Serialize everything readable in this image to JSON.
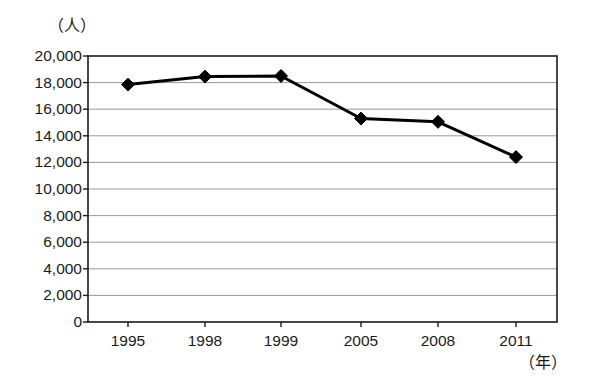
{
  "chart_data": {
    "type": "line",
    "title": "",
    "subtitle": "",
    "xlabel": "（年）",
    "ylabel": "（人）",
    "categories": [
      "1995",
      "1998",
      "1999",
      "2005",
      "2008",
      "2011"
    ],
    "values": [
      17850,
      18450,
      18500,
      15300,
      15050,
      12400
    ],
    "series": [
      {
        "name": "",
        "values": [
          17850,
          18450,
          18500,
          15300,
          15050,
          12400
        ]
      }
    ],
    "ylim": [
      0,
      20000
    ],
    "ytick_labels": [
      "20,000",
      "18,000",
      "16,000",
      "14,000",
      "12,000",
      "10,000",
      "8,000",
      "6,000",
      "4,000",
      "2,000",
      "0"
    ],
    "ytick_values": [
      20000,
      18000,
      16000,
      14000,
      12000,
      10000,
      8000,
      6000,
      4000,
      2000,
      0
    ],
    "ytick_step": 2000,
    "grid": true,
    "grid_axis": "y",
    "legend": "none",
    "marker": "diamond",
    "line_color": "#000000",
    "marker_color": "#000000",
    "grid_color": "#999999",
    "axis_color": "#1a1a1a",
    "background": "#ffffff"
  },
  "axis": {
    "y_unit": "（人）",
    "x_unit": "（年）"
  }
}
